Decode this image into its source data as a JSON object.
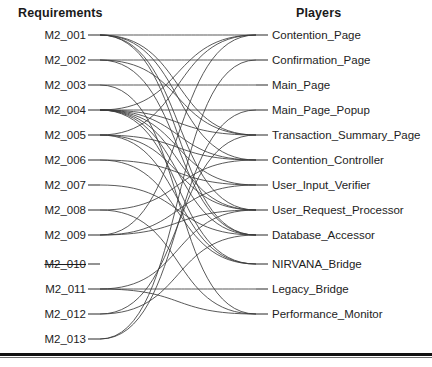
{
  "figure": {
    "type": "bipartite-traceability-graph",
    "width": 432,
    "height": 367,
    "background_color": "#ffffff",
    "edge_color": "#3b3b3b",
    "text_color": "#1d1d1d"
  },
  "columns": {
    "left": {
      "title": "Requirements"
    },
    "right": {
      "title": "Players"
    }
  },
  "left_nodes": [
    {
      "id": "M2_001",
      "label": "M2_001",
      "y": 35,
      "struck": false
    },
    {
      "id": "M2_002",
      "label": "M2_002",
      "y": 60,
      "struck": false
    },
    {
      "id": "M2_003",
      "label": "M2_003",
      "y": 85,
      "struck": false
    },
    {
      "id": "M2_004",
      "label": "M2_004",
      "y": 110,
      "struck": false
    },
    {
      "id": "M2_005",
      "label": "M2_005",
      "y": 135,
      "struck": false
    },
    {
      "id": "M2_006",
      "label": "M2_006",
      "y": 160,
      "struck": false
    },
    {
      "id": "M2_007",
      "label": "M2_007",
      "y": 185,
      "struck": false
    },
    {
      "id": "M2_008",
      "label": "M2_008",
      "y": 210,
      "struck": false
    },
    {
      "id": "M2_009",
      "label": "M2_009",
      "y": 235,
      "struck": false
    },
    {
      "id": "M2_010",
      "label": "M2_010",
      "y": 264,
      "struck": true
    },
    {
      "id": "M2_011",
      "label": "M2_011",
      "y": 289,
      "struck": false
    },
    {
      "id": "M2_012",
      "label": "M2_012",
      "y": 314,
      "struck": false
    },
    {
      "id": "M2_013",
      "label": "M2_013",
      "y": 339,
      "struck": false
    }
  ],
  "right_nodes": [
    {
      "id": "P01",
      "label": "Contention_Page",
      "y": 35
    },
    {
      "id": "P02",
      "label": "Confirmation_Page",
      "y": 60
    },
    {
      "id": "P03",
      "label": "Main_Page",
      "y": 85
    },
    {
      "id": "P04",
      "label": "Main_Page_Popup",
      "y": 110
    },
    {
      "id": "P05",
      "label": "Transaction_Summary_Page",
      "y": 135
    },
    {
      "id": "P06",
      "label": "Contention_Controller",
      "y": 160
    },
    {
      "id": "P07",
      "label": "User_Input_Verifier",
      "y": 185
    },
    {
      "id": "P08",
      "label": "User_Request_Processor",
      "y": 210
    },
    {
      "id": "P09",
      "label": "Database_Accessor",
      "y": 235
    },
    {
      "id": "P10",
      "label": "NIRVANA_Bridge",
      "y": 264
    },
    {
      "id": "P11",
      "label": "Legacy_Bridge",
      "y": 289
    },
    {
      "id": "P12",
      "label": "Performance_Monitor",
      "y": 314
    }
  ],
  "geometry": {
    "left_stub_x1": 88,
    "left_stub_x2": 100,
    "right_stub_x1": 256,
    "right_stub_x2": 268,
    "curve_left_x": 100,
    "curve_right_x": 256
  },
  "edges": [
    {
      "from": "M2_001",
      "to": "P01"
    },
    {
      "from": "M2_001",
      "to": "P05"
    },
    {
      "from": "M2_001",
      "to": "P06"
    },
    {
      "from": "M2_001",
      "to": "P08"
    },
    {
      "from": "M2_001",
      "to": "P09"
    },
    {
      "from": "M2_002",
      "to": "P02"
    },
    {
      "from": "M2_002",
      "to": "P05"
    },
    {
      "from": "M2_002",
      "to": "P09"
    },
    {
      "from": "M2_003",
      "to": "P03"
    },
    {
      "from": "M2_003",
      "to": "P12"
    },
    {
      "from": "M2_004",
      "to": "P01"
    },
    {
      "from": "M2_004",
      "to": "P04"
    },
    {
      "from": "M2_004",
      "to": "P05"
    },
    {
      "from": "M2_004",
      "to": "P06"
    },
    {
      "from": "M2_004",
      "to": "P07"
    },
    {
      "from": "M2_004",
      "to": "P08"
    },
    {
      "from": "M2_004",
      "to": "P09"
    },
    {
      "from": "M2_004",
      "to": "P10"
    },
    {
      "from": "M2_005",
      "to": "P01"
    },
    {
      "from": "M2_005",
      "to": "P06"
    },
    {
      "from": "M2_005",
      "to": "P08"
    },
    {
      "from": "M2_005",
      "to": "P10"
    },
    {
      "from": "M2_006",
      "to": "P07"
    },
    {
      "from": "M2_006",
      "to": "P10"
    },
    {
      "from": "M2_007",
      "to": "P09"
    },
    {
      "from": "M2_008",
      "to": "P06"
    },
    {
      "from": "M2_008",
      "to": "P12"
    },
    {
      "from": "M2_009",
      "to": "P01"
    },
    {
      "from": "M2_009",
      "to": "P07"
    },
    {
      "from": "M2_009",
      "to": "P08"
    },
    {
      "from": "M2_011",
      "to": "P11"
    },
    {
      "from": "M2_011",
      "to": "P08"
    },
    {
      "from": "M2_011",
      "to": "P12"
    },
    {
      "from": "M2_012",
      "to": "P05"
    },
    {
      "from": "M2_012",
      "to": "P09"
    },
    {
      "from": "M2_013",
      "to": "P02"
    },
    {
      "from": "M2_013",
      "to": "P04"
    }
  ]
}
